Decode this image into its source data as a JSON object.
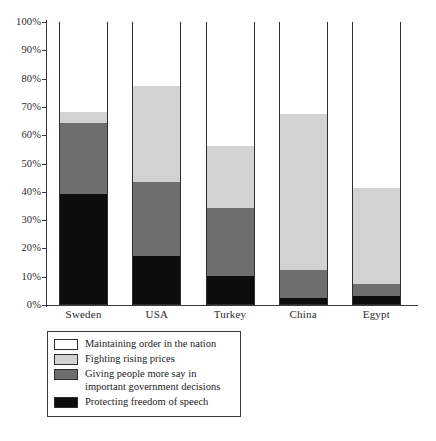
{
  "chart_data": {
    "type": "bar",
    "subtype": "stacked-100-percent",
    "title": "",
    "subtitle": "",
    "xlabel": "",
    "ylabel": "",
    "ylim": [
      0,
      100
    ],
    "grid": false,
    "legend_position": "bottom-left",
    "categories": [
      "Sweden",
      "USA",
      "Turkey",
      "China",
      "Egypt"
    ],
    "tick_labels": [
      "100%",
      "90%",
      "80%",
      "70%",
      "60%",
      "50%",
      "40%",
      "30%",
      "20%",
      "10%",
      "0%"
    ],
    "tick_values": [
      100,
      90,
      80,
      70,
      60,
      50,
      40,
      30,
      20,
      10,
      0
    ],
    "series": [
      {
        "name": "Protecting freedom of speech",
        "color": "#0d0d0d",
        "values": [
          39,
          17,
          10,
          2,
          3
        ]
      },
      {
        "name": "Giving people more say in important government decisions",
        "color": "#6e6e6e",
        "values": [
          25,
          26,
          24,
          10,
          4
        ]
      },
      {
        "name": "Fighting rising prices",
        "color": "#d2d2d2",
        "values": [
          4,
          34,
          22,
          55,
          34
        ]
      },
      {
        "name": "Maintaining order in the nation",
        "color": "#ffffff",
        "values": [
          32,
          23,
          44,
          33,
          59
        ]
      }
    ],
    "legend_entries": [
      {
        "label": "Maintaining order in the nation",
        "color": "#ffffff"
      },
      {
        "label": "Fighting rising prices",
        "color": "#d2d2d2"
      },
      {
        "label": "Giving people more say in",
        "label2": "important government decisions",
        "color": "#6e6e6e"
      },
      {
        "label": "Protecting freedom of speech",
        "color": "#0d0d0d"
      }
    ]
  },
  "axis": {
    "ticks": [
      {
        "label": "100%",
        "value": 100
      },
      {
        "label": "90%",
        "value": 90
      },
      {
        "label": "80%",
        "value": 80
      },
      {
        "label": "70%",
        "value": 70
      },
      {
        "label": "60%",
        "value": 60
      },
      {
        "label": "50%",
        "value": 50
      },
      {
        "label": "40%",
        "value": 40
      },
      {
        "label": "30%",
        "value": 30
      },
      {
        "label": "20%",
        "value": 20
      },
      {
        "label": "10%",
        "value": 10
      },
      {
        "label": "0%",
        "value": 0
      }
    ]
  },
  "bars": [
    {
      "label": "Sweden"
    },
    {
      "label": "USA"
    },
    {
      "label": "Turkey"
    },
    {
      "label": "China"
    },
    {
      "label": "Egypt"
    }
  ],
  "legend": {
    "rows": [
      {
        "text": "Maintaining order in the nation"
      },
      {
        "text": "Fighting rising prices"
      },
      {
        "text": "Giving people more say in",
        "text2": "important government decisions"
      },
      {
        "text": "Protecting freedom of speech"
      }
    ]
  },
  "colors": {
    "maintaining_order": "#ffffff",
    "fighting_prices": "#d2d2d2",
    "more_say": "#6e6e6e",
    "freedom_speech": "#0d0d0d",
    "axis": "#3a3a3a",
    "outline": "#2e2e2e"
  }
}
